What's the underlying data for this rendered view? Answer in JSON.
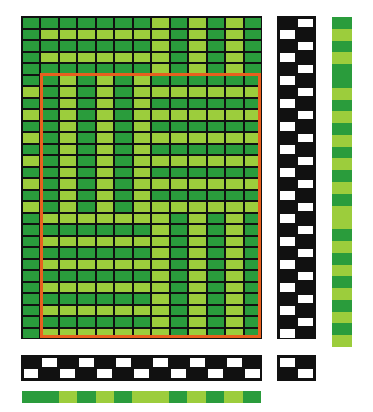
{
  "colors": {
    "dark": "#2a9c3c",
    "light": "#9ccd3c",
    "grid": "#111111",
    "raised": "#ffffff",
    "repeat_outline": "#e8601e"
  },
  "drawdown": {
    "columns": 13,
    "rows": [
      "DDDDDDDLDLDLD",
      "DLLLLLLLDLDLD",
      "DDDDDDDLDLDLD",
      "DLLLLLLLDLDLD",
      "DDDDDDDLDLDLD",
      "DDLDLDLDDDDDD",
      "LDLDLDLLLLLLL",
      "DDLDLDLDDDDDD",
      "LDLDLDLLLLLLL",
      "DDLDLDLDDDDDD",
      "LDLDLDLLLLLLL",
      "DDLDLDLDDDDDD",
      "LDLDLDLLLLLLL",
      "DDLDLDLDDDDDD",
      "LDLDLDLLLLLLL",
      "DDLDLDLDDDDDD",
      "LDLDLDLLLLLLL",
      "DLLLLLLLDLDLD",
      "DDDDDDDLDLDLD",
      "DLLLLLLLDLDLD",
      "DDDDDDDLDLDLD",
      "DLLLLLLLDLDLD",
      "DDDDDDDLDLDLD",
      "DLLLLLLLDLDLD",
      "DDDDDDDLDLDLD",
      "DLLLLLLLDLDLD",
      "DDDDDDDLDLDLD",
      "DLLLLLLLDLDLD"
    ]
  },
  "threading": {
    "rows": [
      "BWBWBWBWBWBWB",
      "WBWBWBWBWBWBW"
    ]
  },
  "treadling": {
    "pattern_even_row": "BW",
    "pattern_odd_row": "WB"
  },
  "tieup": {
    "rows": [
      "WB",
      "BW"
    ]
  },
  "warp_colors": "DDLDLDLLDLDLD",
  "weft_colors": "DLDLDDLDLDLDLDLDLLDLDLDLDLDL",
  "repeat_region": {
    "start_row": 5,
    "end_row": 27,
    "start_col": 1,
    "end_col": 12
  }
}
